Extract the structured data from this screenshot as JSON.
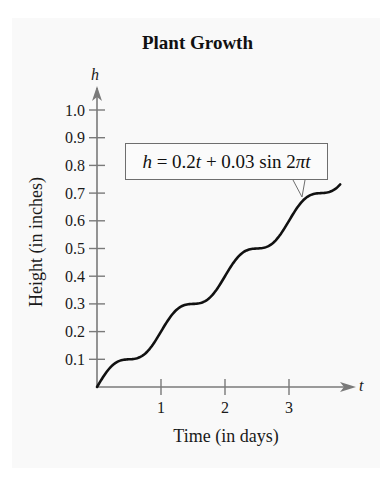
{
  "title": "Plant Growth",
  "equation": {
    "lhs": "h",
    "rhs_parts": [
      "0.2",
      "t",
      " + 0.03 sin 2",
      "π",
      "t"
    ],
    "full_text": "h = 0.2t + 0.03 sin 2πt"
  },
  "axes": {
    "x_var": "t",
    "y_var": "h",
    "x_label": "Time (in days)",
    "y_label": "Height (in inches)"
  },
  "colors": {
    "curve": "#111111",
    "axis": "#7a7a7a",
    "box_border": "#6e6e6e"
  },
  "chart_data": {
    "type": "line",
    "title": "Plant Growth",
    "xlabel": "Time (in days)",
    "ylabel": "Height (in inches)",
    "x_var": "t",
    "y_var": "h",
    "function": "h = 0.2t + 0.03 sin 2πt",
    "annotation": "h = 0.2t + 0.03 sin 2πt",
    "xlim": [
      0,
      4
    ],
    "ylim": [
      0,
      1.0
    ],
    "x_ticks": [
      1,
      2,
      3
    ],
    "x_tick_labels": [
      "1",
      "2",
      "3"
    ],
    "y_ticks": [
      0.1,
      0.2,
      0.3,
      0.4,
      0.5,
      0.6,
      0.7,
      0.8,
      0.9,
      1.0
    ],
    "y_tick_labels": [
      "0.1",
      "0.2",
      "0.3",
      "0.4",
      "0.5",
      "0.6",
      "0.7",
      "0.8",
      "0.9",
      "1.0"
    ],
    "grid": false,
    "legend": "none",
    "series": [
      {
        "name": "h = 0.2t + 0.03 sin 2πt",
        "x": [
          0,
          0.25,
          0.5,
          0.75,
          1.0,
          1.25,
          1.5,
          1.75,
          2.0,
          2.25,
          2.5,
          2.75,
          3.0,
          3.25,
          3.5,
          3.75,
          3.8
        ],
        "values": [
          0,
          0.08,
          0.1,
          0.12,
          0.2,
          0.28,
          0.3,
          0.32,
          0.4,
          0.48,
          0.5,
          0.52,
          0.6,
          0.68,
          0.7,
          0.72,
          0.73
        ]
      }
    ]
  }
}
